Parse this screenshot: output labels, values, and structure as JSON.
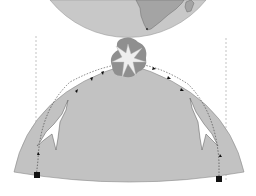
{
  "figure": {
    "colors": {
      "background": "#ffffff",
      "globe": "#c2c2c2",
      "land": "#a6a6a6",
      "explosion_cloud": "#8f8f8f",
      "explosion_star": "#eeeeee",
      "trajectory": "#222222",
      "launch_site": "#111111"
    },
    "elements": [
      {
        "name": "upper-globe",
        "label": ""
      },
      {
        "name": "lower-globe-cap",
        "label": ""
      },
      {
        "name": "explosion",
        "label": ""
      },
      {
        "name": "left-aircraft",
        "label": ""
      },
      {
        "name": "right-aircraft",
        "label": ""
      },
      {
        "name": "left-launch-site",
        "label": ""
      },
      {
        "name": "right-launch-site",
        "label": ""
      }
    ]
  }
}
